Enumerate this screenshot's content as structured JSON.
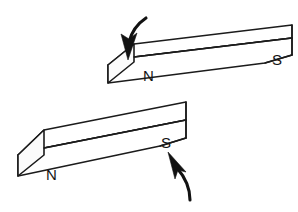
{
  "figure": {
    "background_color": "#ffffff",
    "line_color": "#1b1b1b",
    "label_color": "#141414",
    "arrow_color": "#121212",
    "width": 298,
    "height": 212
  },
  "magnets": [
    {
      "id": "magnet-top",
      "north_label": "N",
      "south_label": "S",
      "north_label_x": 143,
      "north_label_y": 81,
      "south_label_x": 277,
      "south_label_y": 65,
      "front_face": "108,65 134,57 292,38 292,55 265,63 108,83",
      "top_face": "108,65 134,44 292,25 292,38 134,57",
      "end_face": "108,65 134,44 134,57 134,62 108,83",
      "divider_front": "134,57 292,38",
      "divider_end": "134,57 108,65",
      "far_edge": "292,25 292,55",
      "bevel": "265,63 292,55"
    },
    {
      "id": "magnet-bottom",
      "north_label": "N",
      "south_label": "S",
      "north_label_x": 46,
      "north_label_y": 180,
      "south_label_x": 166,
      "south_label_y": 148,
      "front_face": "18,155 44,148 186,120 186,138 160,146 18,176",
      "top_face": "18,155 44,130 186,102 186,120 44,148",
      "end_face": "18,155 44,130 44,148 44,155 18,176",
      "divider_front": "44,148 186,120",
      "divider_end": "44,148 18,155",
      "far_edge": "186,102 186,138",
      "bevel": "160,146 186,138"
    }
  ],
  "arrows": [
    {
      "id": "arrow-top",
      "description": "curved arrow pointing down onto the north end of the top magnet",
      "direction": "down",
      "tail_path": "M 146,18 C 140,22 132,30 129,42",
      "head_points": "128,60 121,34 129,39 137,33"
    },
    {
      "id": "arrow-bottom",
      "description": "curved arrow pointing up toward the south end of the bottom magnet",
      "direction": "up",
      "tail_path": "M 190,200 C 190,188 184,176 177,168",
      "head_points": "168,152 186,172 178,170 175,179"
    }
  ]
}
